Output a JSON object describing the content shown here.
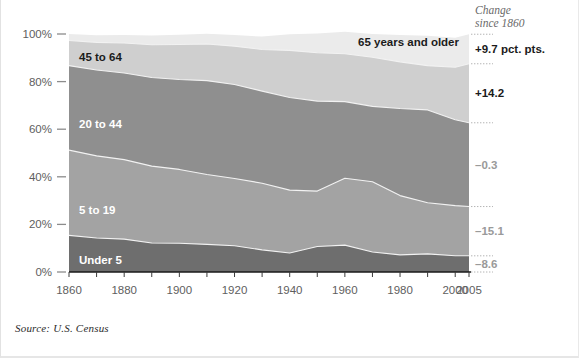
{
  "figure": {
    "source_note": "Source: U.S. Census",
    "change_header_line1": "Change",
    "change_header_line2": "since 1860",
    "y_ticks": [
      "0%",
      "20%",
      "40%",
      "60%",
      "80%",
      "100%"
    ],
    "x_ticks": [
      "1860",
      "1880",
      "1900",
      "1920",
      "1940",
      "1960",
      "1980",
      "2000",
      "2005"
    ]
  },
  "colors": {
    "under5": "#6e6e6e",
    "age5to19": "#a3a3a3",
    "age20to44": "#8f8f8f",
    "age45to64": "#cfcfcf",
    "age65plus": "#ebebeb",
    "axis": "#1a1a1a",
    "tick_text": "#5e5e5e",
    "change_dark": "#1b1b1b",
    "change_muted": "#9a9a9a"
  },
  "chart_data": {
    "type": "area",
    "title": "",
    "subtitle": "",
    "xlabel": "",
    "ylabel": "",
    "stacked": true,
    "normalized": true,
    "grid": false,
    "legend": "inline-band-labels",
    "xlim": [
      1860,
      2005
    ],
    "ylim": [
      0,
      100
    ],
    "x_tick_interval": 10,
    "x_label_interval": 20,
    "x": [
      1860,
      1870,
      1880,
      1890,
      1900,
      1910,
      1920,
      1930,
      1940,
      1950,
      1960,
      1970,
      1980,
      1990,
      2000,
      2005
    ],
    "series": [
      {
        "name": "Under 5",
        "label": "Under 5",
        "color": "#6e6e6e",
        "change_since_1860": "–8.6",
        "change_emphasis": "muted",
        "values": [
          15.4,
          14.3,
          13.8,
          12.2,
          12.1,
          11.6,
          11.0,
          9.3,
          8.0,
          10.7,
          11.3,
          8.4,
          7.2,
          7.6,
          6.8,
          6.8
        ]
      },
      {
        "name": "5 to 19",
        "label": "5 to 19",
        "color": "#a3a3a3",
        "change_since_1860": "–15.1",
        "change_emphasis": "muted",
        "values": [
          35.8,
          34.5,
          33.4,
          32.3,
          31.0,
          29.4,
          28.3,
          28.0,
          26.4,
          23.3,
          28.1,
          29.5,
          24.9,
          21.5,
          21.1,
          20.7
        ]
      },
      {
        "name": "20 to 44",
        "label": "20 to 44",
        "color": "#8f8f8f",
        "change_since_1860": "–0.3",
        "change_emphasis": "muted",
        "values": [
          35.5,
          36.1,
          36.4,
          37.2,
          37.8,
          39.4,
          39.5,
          38.7,
          38.9,
          37.8,
          32.2,
          31.7,
          36.6,
          39.0,
          36.1,
          35.2
        ]
      },
      {
        "name": "45 to 64",
        "label": "45 to 64",
        "color": "#cfcfcf",
        "change_since_1860": "+14.2",
        "change_emphasis": "dark",
        "values": [
          10.6,
          11.6,
          12.6,
          13.8,
          14.7,
          15.4,
          16.1,
          17.5,
          19.8,
          20.3,
          20.1,
          20.6,
          19.6,
          18.6,
          22.0,
          24.8
        ]
      },
      {
        "name": "65 years and older",
        "label": "65 years and older",
        "color": "#ebebeb",
        "change_since_1860": "+9.7 pct. pts.",
        "change_emphasis": "dark",
        "values": [
          2.7,
          3.0,
          3.4,
          3.9,
          4.1,
          4.3,
          4.7,
          5.4,
          6.8,
          8.1,
          9.2,
          9.8,
          11.3,
          12.6,
          12.4,
          12.4
        ]
      }
    ]
  }
}
